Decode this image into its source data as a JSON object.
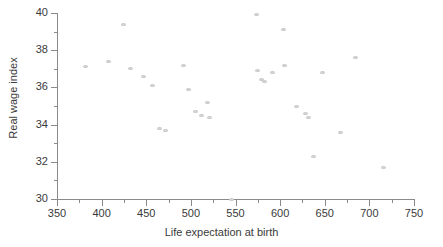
{
  "chart_data": {
    "type": "scatter",
    "title": "",
    "xlabel": "Life expectation at birth",
    "ylabel": "Real wage index",
    "xlim": [
      350,
      750
    ],
    "ylim": [
      30,
      40
    ],
    "xticks": [
      350,
      400,
      450,
      500,
      550,
      600,
      650,
      700,
      750
    ],
    "yticks": [
      30,
      32,
      34,
      36,
      38,
      40
    ],
    "xtick_minor_step": 25,
    "ytick_minor_step": 1,
    "grid": false,
    "legend": null,
    "marker_color": "#d8d8d8",
    "axis_color": "#8a8a8a",
    "text_color": "#3a3a3a",
    "points": [
      {
        "x": 382,
        "y": 37.1
      },
      {
        "x": 408,
        "y": 37.4
      },
      {
        "x": 425,
        "y": 39.4
      },
      {
        "x": 432,
        "y": 37.0
      },
      {
        "x": 447,
        "y": 36.6
      },
      {
        "x": 457,
        "y": 36.1
      },
      {
        "x": 465,
        "y": 33.8
      },
      {
        "x": 472,
        "y": 33.7
      },
      {
        "x": 492,
        "y": 37.2
      },
      {
        "x": 497,
        "y": 35.9
      },
      {
        "x": 505,
        "y": 34.7
      },
      {
        "x": 512,
        "y": 34.5
      },
      {
        "x": 519,
        "y": 35.2
      },
      {
        "x": 521,
        "y": 34.4
      },
      {
        "x": 545,
        "y": 30.0
      },
      {
        "x": 573,
        "y": 39.9
      },
      {
        "x": 575,
        "y": 36.9
      },
      {
        "x": 579,
        "y": 36.4
      },
      {
        "x": 583,
        "y": 36.3
      },
      {
        "x": 592,
        "y": 36.8
      },
      {
        "x": 604,
        "y": 39.1
      },
      {
        "x": 605,
        "y": 37.2
      },
      {
        "x": 618,
        "y": 35.0
      },
      {
        "x": 628,
        "y": 34.6
      },
      {
        "x": 632,
        "y": 34.4
      },
      {
        "x": 637,
        "y": 32.3
      },
      {
        "x": 648,
        "y": 36.8
      },
      {
        "x": 668,
        "y": 33.6
      },
      {
        "x": 684,
        "y": 37.6
      },
      {
        "x": 716,
        "y": 31.7
      }
    ]
  }
}
